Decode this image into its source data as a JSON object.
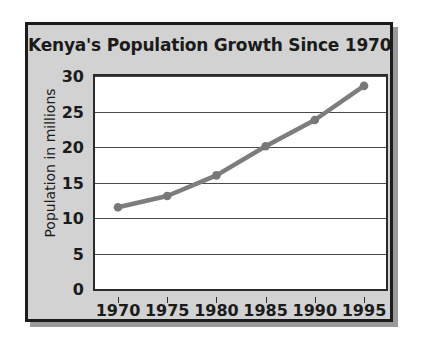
{
  "chart_data": {
    "type": "line",
    "title": "Kenya's Population Growth Since 1970",
    "xlabel": "",
    "ylabel": "Population in millions",
    "categories": [
      "1970",
      "1975",
      "1980",
      "1985",
      "1990",
      "1995"
    ],
    "x": [
      1970,
      1975,
      1980,
      1985,
      1990,
      1995
    ],
    "values": [
      11.5,
      13.1,
      16.0,
      20.1,
      23.8,
      28.6
    ],
    "series": [
      {
        "name": "Population",
        "values": [
          11.5,
          13.1,
          16.0,
          20.1,
          23.8,
          28.6
        ]
      }
    ],
    "ylim": [
      0,
      30
    ],
    "yticks": [
      0,
      5,
      10,
      15,
      20,
      25,
      30
    ],
    "ytick_labels": [
      "0",
      "5",
      "10",
      "15",
      "20",
      "25",
      "30"
    ],
    "xtick_labels": [
      "1970",
      "1975",
      "1980",
      "1985",
      "1990",
      "1995"
    ],
    "grid": "horizontal",
    "legend": "none",
    "line_color": "#7d7d7d",
    "marker_color": "#787878",
    "plot_background": "#ffffff",
    "panel_background": "#d2d2d2",
    "frame_color": "#1c1c1c",
    "text_color": "#1b1b1b"
  }
}
